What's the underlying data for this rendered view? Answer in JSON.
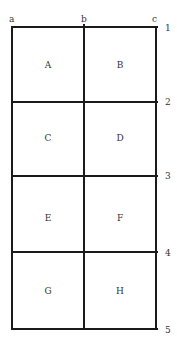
{
  "columns": [
    {
      "label": "a",
      "x": 12
    },
    {
      "label": "b",
      "x": 84
    },
    {
      "label": "c",
      "x": 156
    }
  ],
  "rows": [
    {
      "label": "1",
      "y": 27
    },
    {
      "label": "2",
      "y": 102
    },
    {
      "label": "3",
      "y": 176
    },
    {
      "label": "4",
      "y": 252
    },
    {
      "label": "5",
      "y": 329
    }
  ],
  "cells": [
    {
      "label": "A",
      "row": 0,
      "col": 0
    },
    {
      "label": "B",
      "row": 0,
      "col": 1
    },
    {
      "label": "C",
      "row": 1,
      "col": 0
    },
    {
      "label": "D",
      "row": 1,
      "col": 1
    },
    {
      "label": "E",
      "row": 2,
      "col": 0
    },
    {
      "label": "F",
      "row": 2,
      "col": 1
    },
    {
      "label": "G",
      "row": 3,
      "col": 0
    },
    {
      "label": "H",
      "row": 3,
      "col": 1
    }
  ]
}
